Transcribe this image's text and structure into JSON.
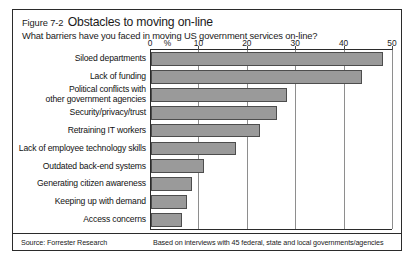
{
  "figure": {
    "number": "Figure 7-2",
    "title": "Obstacles to moving on-line",
    "subtitle": "What barriers have you faced in moving US government services on-line?",
    "source": "Source: Forrester Research",
    "basis": "Based on interviews with 45 federal, state and local governments/agencies",
    "bar_color": "#9a9a9a",
    "bar_border_color": "#4d4d4d",
    "frame_color": "#2b2b2b",
    "grid_color": "#8e8e8e"
  },
  "chart_data": {
    "type": "bar",
    "orientation": "horizontal",
    "title": "Obstacles to moving on-line",
    "subtitle": "What barriers have you faced in moving US government services on-line?",
    "xlabel": "%",
    "ylabel": "",
    "xlim": [
      0,
      50
    ],
    "xticks": [
      0,
      10,
      20,
      30,
      40,
      50
    ],
    "xticklabels": [
      "0",
      "10",
      "20",
      "30",
      "40",
      "50"
    ],
    "unit_label": "%",
    "grid": true,
    "legend": false,
    "categories": [
      "Siloed departments",
      "Lack of funding",
      "Political conflicts with other government agencies",
      "Security/privacy/trust",
      "Retraining IT workers",
      "Lack of employee technology skills",
      "Outdated back-end systems",
      "Generating citizen awareness",
      "Keeping up with demand",
      "Access concerns"
    ],
    "category_lines": [
      [
        "Siloed departments"
      ],
      [
        "Lack of funding"
      ],
      [
        "Political conflicts with",
        "other government agencies"
      ],
      [
        "Security/privacy/trust"
      ],
      [
        "Retraining IT workers"
      ],
      [
        "Lack of employee technology skills"
      ],
      [
        "Outdated back-end systems"
      ],
      [
        "Generating citizen awareness"
      ],
      [
        "Keeping up with demand"
      ],
      [
        "Access concerns"
      ]
    ],
    "values": [
      48,
      43.5,
      28,
      26,
      22.5,
      17.5,
      11,
      8.5,
      7.5,
      6.5
    ]
  }
}
